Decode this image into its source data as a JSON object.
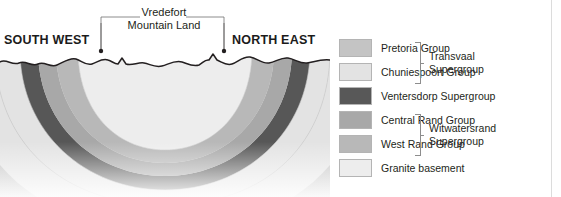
{
  "cross_section": {
    "direction_left": "SOUTH WEST",
    "direction_right": "NORTH EAST",
    "feature_label_line1": "Vredefort",
    "feature_label_line2": "Mountain Land"
  },
  "legend": {
    "items": [
      {
        "label": "Pretoria Group",
        "color": "#c4c4c4"
      },
      {
        "label": "Chuniespoort Group",
        "color": "#e3e3e3"
      },
      {
        "label": "Ventersdorp Supergroup",
        "color": "#585858"
      },
      {
        "label": "Central Rand Group",
        "color": "#a8a8a8"
      },
      {
        "label": "West Rand Group",
        "color": "#b8b8b8"
      },
      {
        "label": "Granite basement",
        "color": "#ededed"
      }
    ],
    "groups": [
      {
        "name_line1": "Transvaal",
        "name_line2": "Supergroup"
      },
      {
        "name_line1": "Witwatersrand",
        "name_line2": "Supergroup"
      }
    ]
  },
  "colors": {
    "pretoria": "#c4c4c4",
    "chuniespoort": "#e3e3e3",
    "ventersdorp": "#585858",
    "central_rand": "#a8a8a8",
    "west_rand": "#b8b8b8",
    "granite": "#ededed",
    "surface_line": "#231f20",
    "bracket": "#8d8d8d"
  }
}
